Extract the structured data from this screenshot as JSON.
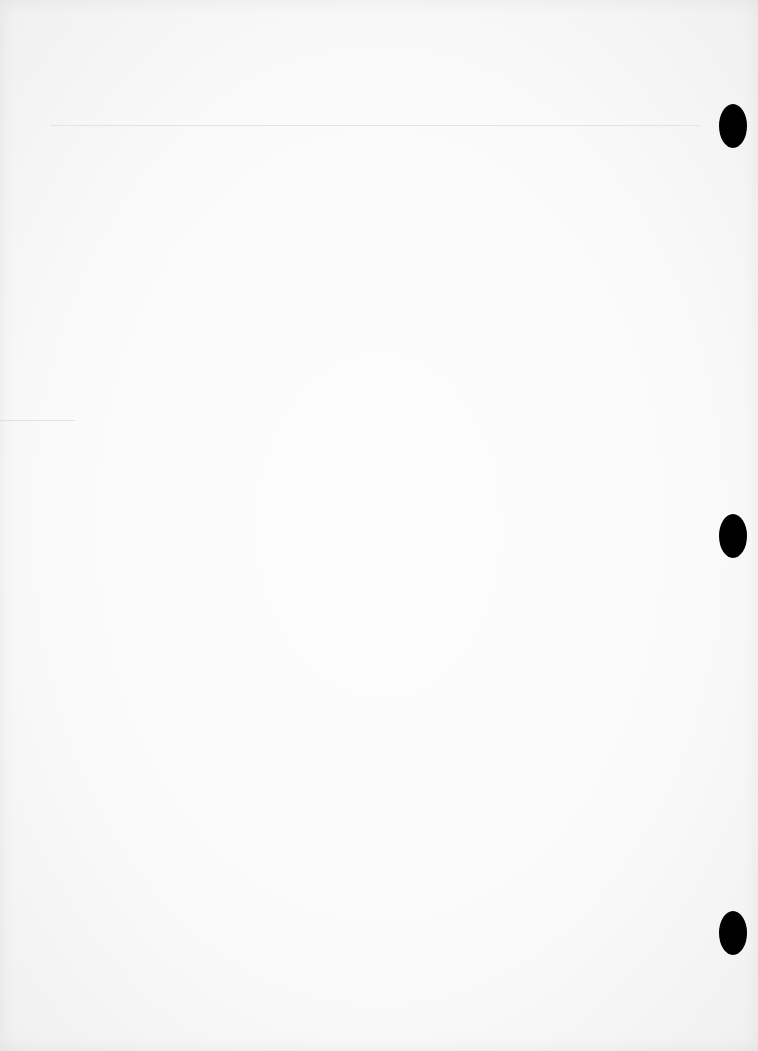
{
  "page": {
    "type": "blank-sheet",
    "background_color": "#fafafa",
    "text": ""
  },
  "rules": [
    {
      "x": 50,
      "y": 125,
      "width": 650
    },
    {
      "x": 0,
      "y": 420,
      "width": 75
    }
  ],
  "punch_holes": [
    {
      "x": 719,
      "y": 104
    },
    {
      "x": 719,
      "y": 514
    },
    {
      "x": 719,
      "y": 911
    }
  ],
  "colors": {
    "hole": "#000000",
    "rule": "#e4e4e4"
  }
}
